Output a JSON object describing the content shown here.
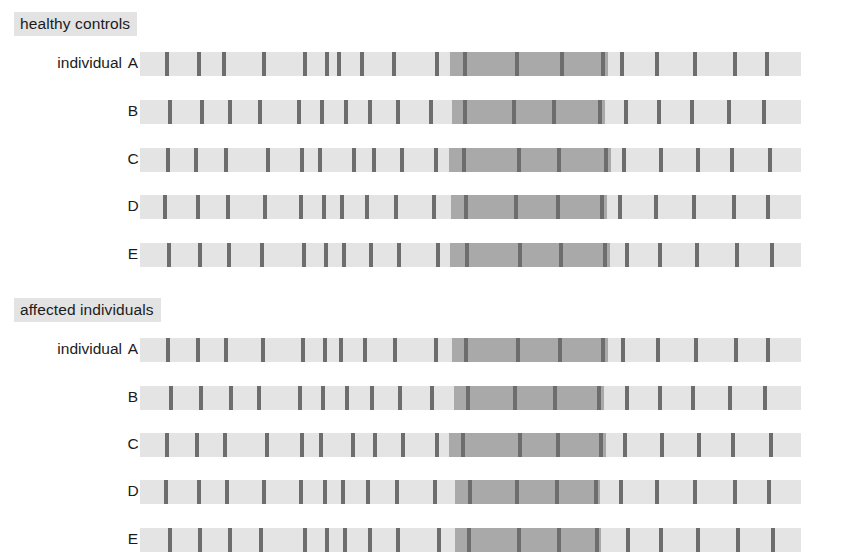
{
  "figure": {
    "type": "haplotype-sharing-diagram",
    "bar_geometry": {
      "bar_left_px": 140,
      "bar_width_px": 661,
      "bar_height_px": 24,
      "tick_width_px": 4
    },
    "colors": {
      "background": "#ffffff",
      "bar_light": "#e4e4e4",
      "shared_block": "#a9a9a9",
      "marker_tick": "#6d6d6d",
      "heading_badge": "#e3e3e3",
      "text": "#1b1b1b"
    }
  },
  "groups": [
    {
      "heading": "healthy controls",
      "top": 12,
      "rows": [
        {
          "label": "individual",
          "id": "A",
          "top": 50,
          "block": {
            "start": 450,
            "end": 608
          },
          "ticks": [
            165,
            197,
            222,
            262,
            303,
            325,
            337,
            360,
            392,
            435,
            463,
            515,
            560,
            601,
            620,
            655,
            693,
            733,
            765
          ]
        },
        {
          "label": "",
          "id": "B",
          "top": 98,
          "block": {
            "start": 452,
            "end": 605
          },
          "ticks": [
            168,
            200,
            228,
            258,
            297,
            320,
            344,
            368,
            396,
            429,
            463,
            512,
            552,
            598,
            624,
            657,
            690,
            727,
            762
          ]
        },
        {
          "label": "",
          "id": "C",
          "top": 146,
          "block": {
            "start": 449,
            "end": 611
          },
          "ticks": [
            166,
            194,
            224,
            266,
            300,
            318,
            352,
            372,
            400,
            434,
            462,
            517,
            557,
            604,
            622,
            659,
            696,
            730,
            768
          ]
        },
        {
          "label": "",
          "id": "D",
          "top": 193,
          "block": {
            "start": 451,
            "end": 607
          },
          "ticks": [
            163,
            196,
            226,
            263,
            299,
            322,
            340,
            365,
            394,
            432,
            464,
            514,
            556,
            600,
            618,
            654,
            692,
            732,
            766
          ]
        },
        {
          "label": "",
          "id": "E",
          "top": 241,
          "block": {
            "start": 450,
            "end": 610
          },
          "ticks": [
            167,
            198,
            227,
            260,
            302,
            324,
            342,
            369,
            397,
            436,
            465,
            518,
            559,
            603,
            625,
            658,
            695,
            735,
            770
          ]
        }
      ]
    },
    {
      "heading": "affected individuals",
      "top": 298,
      "rows": [
        {
          "label": "individual",
          "id": "A",
          "top": 336,
          "block": {
            "start": 452,
            "end": 608
          },
          "ticks": [
            166,
            196,
            224,
            261,
            301,
            323,
            339,
            363,
            393,
            434,
            464,
            516,
            558,
            601,
            621,
            656,
            694,
            734,
            766
          ]
        },
        {
          "label": "",
          "id": "B",
          "top": 384,
          "block": {
            "start": 454,
            "end": 604
          },
          "ticks": [
            169,
            199,
            229,
            257,
            298,
            321,
            345,
            370,
            398,
            430,
            466,
            513,
            553,
            597,
            625,
            658,
            691,
            728,
            763
          ]
        },
        {
          "label": "",
          "id": "C",
          "top": 431,
          "block": {
            "start": 449,
            "end": 606
          },
          "ticks": [
            165,
            195,
            223,
            265,
            300,
            319,
            351,
            373,
            401,
            435,
            461,
            518,
            556,
            599,
            623,
            660,
            697,
            731,
            769
          ]
        },
        {
          "label": "",
          "id": "D",
          "top": 478,
          "block": {
            "start": 455,
            "end": 600
          },
          "ticks": [
            164,
            197,
            225,
            262,
            299,
            323,
            341,
            366,
            395,
            433,
            468,
            515,
            555,
            594,
            619,
            655,
            693,
            733,
            767
          ]
        },
        {
          "label": "",
          "id": "E",
          "top": 526,
          "block": {
            "start": 455,
            "end": 601
          },
          "ticks": [
            168,
            198,
            228,
            259,
            303,
            325,
            343,
            368,
            396,
            437,
            467,
            517,
            557,
            595,
            626,
            659,
            696,
            736,
            771
          ]
        }
      ]
    }
  ]
}
